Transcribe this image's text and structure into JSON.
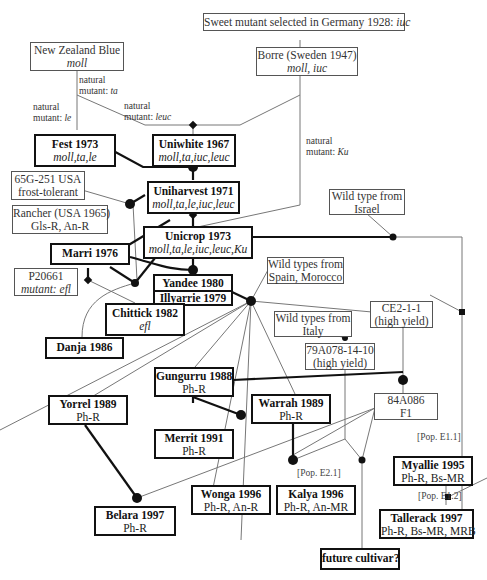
{
  "diagram": {
    "type": "pedigree",
    "nodes": [
      {
        "id": "sweet",
        "name": "Sweet mutant selected in Germany 1928:",
        "sub": "iuc",
        "style": "thin"
      },
      {
        "id": "nzblue",
        "name": "New Zealand Blue",
        "sub": "moll",
        "style": "thin"
      },
      {
        "id": "borre",
        "name": "Borre (Sweden 1947)",
        "sub": "moll, iuc",
        "style": "thin"
      },
      {
        "id": "fest",
        "name": "Fest 1973",
        "sub": "moll,ta,le",
        "style": "thick"
      },
      {
        "id": "uniwhite",
        "name": "Uniwhite 1967",
        "sub": "moll,ta,iuc,leuc",
        "style": "thick"
      },
      {
        "id": "g65",
        "name": "65G-251 USA",
        "sub": "frost-tolerant",
        "style": "thin"
      },
      {
        "id": "uniharvest",
        "name": "Uniharvest 1971",
        "sub": "moll,ta,le,iuc,leuc",
        "style": "thick"
      },
      {
        "id": "rancher",
        "name": "Rancher (USA 1965)",
        "sub": "Gls-R, An-R",
        "style": "thin"
      },
      {
        "id": "israel",
        "name": "Wild type from",
        "sub": "Israel",
        "style": "thin"
      },
      {
        "id": "unicrop",
        "name": "Unicrop 1973",
        "sub": "moll,ta,le,iuc,leuc,Ku",
        "style": "thick"
      },
      {
        "id": "marri",
        "name": "Marri 1976",
        "style": "thick"
      },
      {
        "id": "p20661",
        "name": "P20661",
        "sub": "mutant:  efl",
        "style": "thin"
      },
      {
        "id": "yandee",
        "name": "Yandee 1980",
        "sub": "Illyarrie 1979",
        "style": "thick"
      },
      {
        "id": "spain",
        "name": "Wild types from",
        "sub": "Spain, Morocco",
        "style": "thin"
      },
      {
        "id": "chittick",
        "name": "Chittick 1982",
        "sub": "efl",
        "style": "thick"
      },
      {
        "id": "ce211",
        "name": "CE2-1-1",
        "sub": "(high yield)",
        "style": "thin"
      },
      {
        "id": "italy",
        "name": "Wild types from",
        "sub": "Italy",
        "style": "thin"
      },
      {
        "id": "danja",
        "name": "Danja 1986",
        "style": "thick"
      },
      {
        "id": "a79",
        "name": "79A078-14-10",
        "sub": "(high yield)",
        "style": "thin"
      },
      {
        "id": "gungurru",
        "name": "Gungurru 1988",
        "sub": "Ph-R",
        "style": "thick"
      },
      {
        "id": "yorrel",
        "name": "Yorrel 1989",
        "sub": "Ph-R",
        "style": "thick"
      },
      {
        "id": "warrah",
        "name": "Warrah 1989",
        "sub": "Ph-R",
        "style": "thick"
      },
      {
        "id": "a84",
        "name": "84A086",
        "sub": "F1",
        "style": "thin"
      },
      {
        "id": "merrit",
        "name": "Merrit 1991",
        "sub": "Ph-R",
        "style": "thick"
      },
      {
        "id": "myallie",
        "name": "Myallie 1995",
        "sub": "Ph-R, Bs-MR",
        "style": "thick"
      },
      {
        "id": "wonga",
        "name": "Wonga 1996",
        "sub": "Ph-R, An-R",
        "style": "thick"
      },
      {
        "id": "kalya",
        "name": "Kalya 1996",
        "sub": "Ph-R, An-MR",
        "style": "thick"
      },
      {
        "id": "belara",
        "name": "Belara 1997",
        "sub": "Ph-R",
        "style": "thick"
      },
      {
        "id": "tallerack",
        "name": "Tallerack 1997",
        "sub": "Ph-R, Bs-MR, MRB",
        "style": "thick"
      },
      {
        "id": "future",
        "name": "future cultivar?",
        "style": "thick"
      }
    ],
    "edge_labels": [
      {
        "id": "mut_ta",
        "line1": "natural",
        "line2": "mutant:",
        "gene": "ta"
      },
      {
        "id": "mut_le",
        "line1": "natural",
        "line2": "mutant:",
        "gene": "le"
      },
      {
        "id": "mut_leuc",
        "line1": "natural",
        "line2": "mutant:",
        "gene": "leuc"
      },
      {
        "id": "mut_ku",
        "line1": "natural",
        "line2": "mutant:",
        "gene": "Ku"
      }
    ],
    "population_labels": {
      "e21": "[Pop. E2.1]",
      "e11": "[Pop. E1.1]",
      "e12": "[Pop. E1.2]"
    }
  }
}
